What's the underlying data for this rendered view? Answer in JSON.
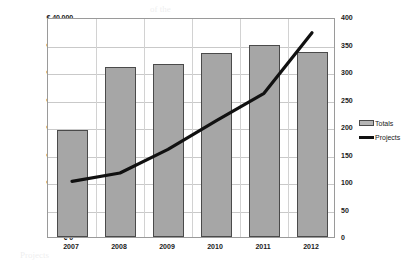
{
  "chart_data": {
    "type": "bar",
    "title": "",
    "categories": [
      "2007",
      "2008",
      "2009",
      "2010",
      "2011",
      "2012"
    ],
    "series": [
      {
        "name": "Totals",
        "type": "bar",
        "axis": "left",
        "values": [
          19500,
          31000,
          31500,
          33500,
          35000,
          33700
        ],
        "color": "#a6a6a6"
      },
      {
        "name": "Projects",
        "type": "line",
        "axis": "right",
        "values": [
          105,
          120,
          163,
          215,
          265,
          375
        ],
        "color": "#111111"
      }
    ],
    "xlabel": "",
    "ylabel": "",
    "ylabel_right": "",
    "ylim": [
      0,
      40000
    ],
    "ylim_right": [
      0,
      400
    ],
    "yticks_left": [
      "€ 0",
      "€ 5,000",
      "€ 10,000",
      "€ 15,000",
      "€ 20,000",
      "€ 25,000",
      "€ 30,000",
      "€ 35,000",
      "€ 40,000"
    ],
    "yticks_left_values": [
      0,
      5000,
      10000,
      15000,
      20000,
      25000,
      30000,
      35000,
      40000
    ],
    "yticks_right": [
      "0",
      "50",
      "100",
      "150",
      "200",
      "250",
      "300",
      "350",
      "400"
    ],
    "yticks_right_values": [
      0,
      50,
      100,
      150,
      200,
      250,
      300,
      350,
      400
    ],
    "grid": true,
    "legend_position": "right",
    "legend": [
      "Totals",
      "Projects"
    ]
  },
  "legend": {
    "totals_label": "Totals",
    "projects_label": "Projects"
  },
  "background_text": [
    "of the",
    "in 2012",
    "€ 33,7",
    "to a",
    "the number of",
    "it is",
    "of",
    "and the",
    "Projects"
  ]
}
